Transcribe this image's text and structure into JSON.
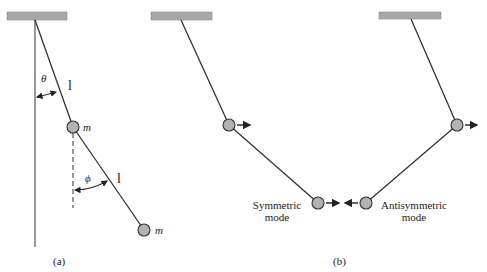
{
  "figure": {
    "panel_a": {
      "caption": "(a)",
      "angle_upper_label": "θ",
      "angle_lower_label": "ϕ",
      "rod_upper_label": "l",
      "rod_lower_label": "l",
      "mass_upper_label": "m",
      "mass_lower_label": "m"
    },
    "panel_b": {
      "caption": "(b)",
      "symmetric_mode": {
        "line1": "Symmetric",
        "line2": "mode"
      },
      "antisymmetric_mode": {
        "line1": "Antisymmetric",
        "line2": "mode"
      }
    }
  },
  "colors": {
    "ceiling": "#a8a8a8",
    "mass_fill": "#b3b3b3",
    "line": "#333333"
  }
}
